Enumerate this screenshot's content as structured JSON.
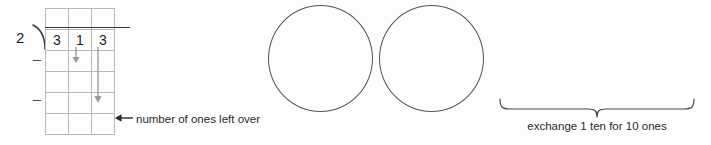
{
  "worksheet": {
    "type": "long-division-with-place-value-chart",
    "division": {
      "divisor": "2",
      "dividend_digits": [
        "3",
        "1",
        "3"
      ],
      "minus_sign": "–",
      "grid": {
        "columns": 3,
        "rows": 6,
        "column_headers": [
          "",
          "",
          ""
        ],
        "cells": [
          [
            "",
            "",
            ""
          ],
          [
            "3",
            "1",
            "3"
          ],
          [
            "",
            "",
            ""
          ],
          [
            "",
            "",
            ""
          ],
          [
            "",
            "",
            ""
          ],
          [
            "",
            "",
            ""
          ]
        ]
      },
      "annotations": {
        "bring_down_tens_icon": "down-arrow-icon",
        "bring_down_ones_icon": "down-arrow-icon",
        "leftover_pointer_icon": "left-arrow-icon",
        "leftover_label": "number of ones left over"
      }
    },
    "place_value_models": {
      "circle_icon": "circle-shape",
      "circles": [
        {
          "name": "ten-circle-1",
          "contents": ""
        },
        {
          "name": "ten-circle-2",
          "contents": ""
        }
      ]
    },
    "exchange": {
      "brace_icon": "curly-brace-icon",
      "caption": "exchange 1 ten for 10 ones"
    }
  },
  "colors": {
    "background": "#fdfdfd",
    "grid_line": "#b9b9b9",
    "heavy_rule": "#4a4a4a",
    "ink": "#1d1d1d",
    "circle_stroke": "#555555",
    "arrow": "#9a9a9a"
  }
}
